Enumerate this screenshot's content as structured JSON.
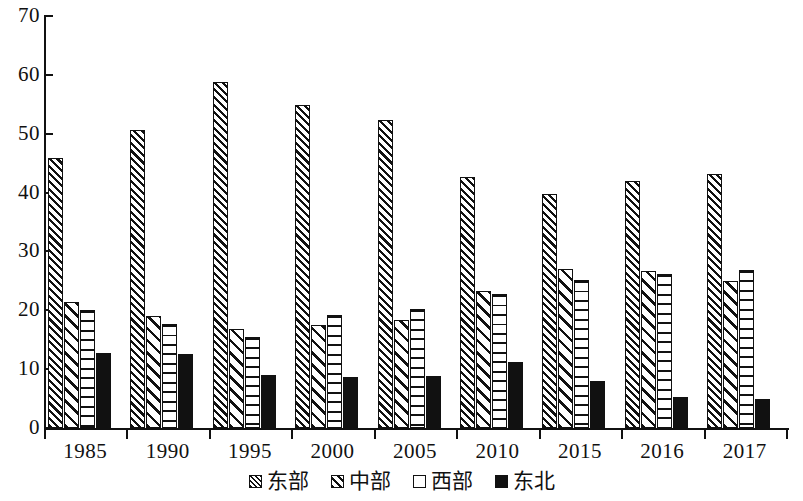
{
  "chart_data": {
    "type": "bar",
    "title": "",
    "subtitle": "",
    "xlabel": "",
    "ylabel": "",
    "ylim": [
      0,
      70
    ],
    "ytick_step": 10,
    "yticks": [
      "0",
      "10",
      "20",
      "30",
      "40",
      "50",
      "60",
      "70"
    ],
    "grid": false,
    "legend_position": "bottom-center",
    "categories": [
      "1985",
      "1990",
      "1995",
      "2000",
      "2005",
      "2010",
      "2015",
      "2016",
      "2017"
    ],
    "series": [
      {
        "name": "东部",
        "pattern": "dense-diagonal-hatch",
        "values": [
          45.9,
          50.6,
          58.8,
          54.8,
          52.3,
          42.7,
          39.8,
          42.0,
          43.2
        ]
      },
      {
        "name": "中部",
        "pattern": "wide-diagonal-hatch",
        "values": [
          21.4,
          19.1,
          16.9,
          17.5,
          18.4,
          23.2,
          27.0,
          26.6,
          24.9
        ]
      },
      {
        "name": "西部",
        "pattern": "horizontal-lines",
        "values": [
          20.1,
          17.7,
          15.4,
          19.2,
          20.2,
          22.8,
          25.2,
          26.1,
          26.9
        ]
      },
      {
        "name": "东北",
        "pattern": "solid-black",
        "values": [
          12.8,
          12.6,
          9.0,
          8.6,
          8.9,
          11.3,
          8.0,
          5.3,
          5.0
        ]
      }
    ]
  },
  "colors": {
    "ink": "#111111",
    "background": "#ffffff"
  }
}
